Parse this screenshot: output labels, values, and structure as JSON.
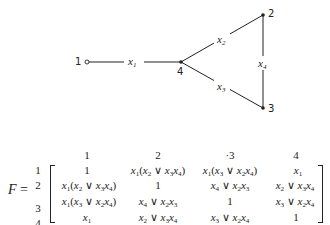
{
  "graph": {
    "nodes": [
      {
        "id": "1",
        "label": "1",
        "x": 87,
        "y": 62,
        "style": "open"
      },
      {
        "id": "2",
        "label": "2",
        "x": 263,
        "y": 15,
        "style": "filled"
      },
      {
        "id": "3",
        "label": "3",
        "x": 263,
        "y": 108,
        "style": "filled"
      },
      {
        "id": "4",
        "label": "4",
        "x": 181,
        "y": 62,
        "style": "filled"
      }
    ],
    "edges": [
      {
        "from": "1",
        "to": "4",
        "label": "x1",
        "var": "x",
        "sub": "1"
      },
      {
        "from": "4",
        "to": "2",
        "label": "x2",
        "var": "x",
        "sub": "2"
      },
      {
        "from": "4",
        "to": "3",
        "label": "x3",
        "var": "x",
        "sub": "3"
      },
      {
        "from": "2",
        "to": "3",
        "label": "x4",
        "var": "x",
        "sub": "4"
      }
    ]
  },
  "matrix": {
    "name": "F",
    "equals": "=",
    "column_headers": [
      "1",
      "2",
      "·3",
      "4"
    ],
    "row_headers": [
      "1",
      "2",
      "3",
      "4"
    ],
    "cells": [
      [
        "1",
        "x1(x2 ∨ x3x4)",
        "x1(x3 ∨ x2x4)",
        "x1"
      ],
      [
        "x1(x2 ∨ x3x4)",
        "1",
        "x4 ∨ x2x3",
        "x2 ∨ x3x4"
      ],
      [
        "x1(x3 ∨ x2x4)",
        "x4 ∨ x2x3",
        "1",
        "x3 ∨ x2x4"
      ],
      [
        "x1",
        "x2 ∨ x3x4",
        "x3 ∨ x2x4",
        "1"
      ]
    ]
  }
}
